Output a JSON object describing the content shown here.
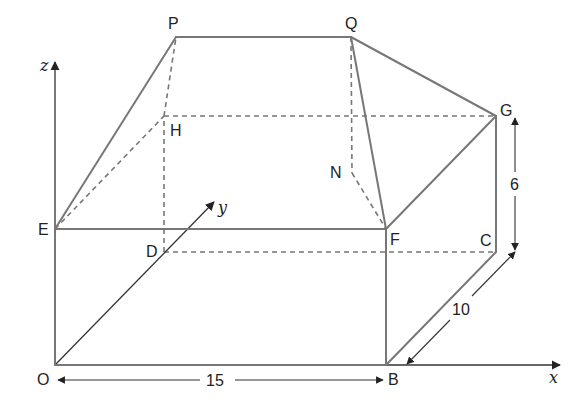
{
  "diagram": {
    "type": "3d-solid-wireframe",
    "colors": {
      "edge": "#777777",
      "axis": "#333333",
      "text": "#222222",
      "background": "#ffffff"
    },
    "vertices": {
      "O": "O",
      "B": "B",
      "C": "C",
      "D": "D",
      "E": "E",
      "F": "F",
      "G": "G",
      "H": "H",
      "P": "P",
      "Q": "Q",
      "N": "N"
    },
    "axes": {
      "x": "x",
      "y": "y",
      "z": "z"
    },
    "dimensions": {
      "OB": "15",
      "BC": "10",
      "CG": "6"
    },
    "visible_edges": [
      "OB",
      "BF",
      "FE",
      "EO",
      "BC",
      "CG",
      "FG",
      "EP",
      "PQ",
      "QF",
      "QG"
    ],
    "hidden_edges": [
      "OD",
      "DC",
      "DH",
      "HG",
      "EH",
      "HP",
      "DH",
      "QN",
      "NF"
    ]
  }
}
